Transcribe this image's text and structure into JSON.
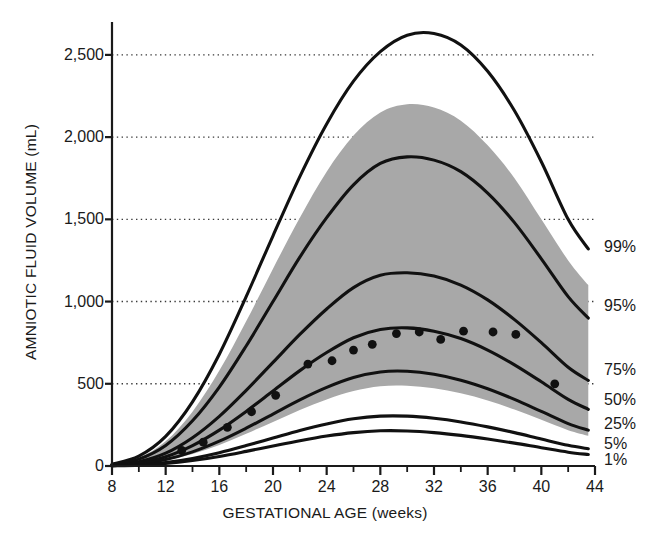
{
  "chart_data": {
    "type": "line",
    "title": "",
    "xlabel": "GESTATIONAL AGE (weeks)",
    "ylabel": "AMNIOTIC FLUID VOLUME (mL)",
    "xlim": [
      8,
      44
    ],
    "ylim": [
      0,
      2700
    ],
    "xticks": [
      8,
      12,
      16,
      20,
      24,
      28,
      32,
      36,
      40,
      44
    ],
    "xtick_labels": [
      "8",
      "12",
      "16",
      "20",
      "24",
      "28",
      "32",
      "36",
      "40",
      "44"
    ],
    "xminor_ticks": [
      10,
      14,
      18,
      22,
      26,
      30,
      34,
      38,
      42
    ],
    "yticks": [
      0,
      500,
      1000,
      1500,
      2000,
      2500
    ],
    "ytick_labels": [
      "0",
      "500",
      "1,000",
      "1,500",
      "2,000",
      "2,500"
    ],
    "grid": "horizontal-dotted",
    "gridlines": [
      500,
      1000,
      1500,
      2000,
      2500
    ],
    "legend": "right-of-axes-inline-labels",
    "x": [
      8,
      10,
      12,
      14,
      16,
      18,
      20,
      22,
      24,
      26,
      28,
      30,
      32,
      34,
      36,
      38,
      40,
      42,
      43.5
    ],
    "series": [
      {
        "name": "99%",
        "label": "99%",
        "color": "#111111",
        "values": [
          10,
          60,
          180,
          390,
          680,
          1030,
          1400,
          1760,
          2080,
          2340,
          2520,
          2620,
          2630,
          2560,
          2400,
          2160,
          1850,
          1500,
          1320
        ]
      },
      {
        "name": "95%",
        "label": "95%",
        "color": "#111111",
        "values": [
          8,
          42,
          125,
          275,
          480,
          730,
          1000,
          1270,
          1510,
          1710,
          1840,
          1880,
          1860,
          1790,
          1660,
          1480,
          1260,
          1030,
          900
        ]
      },
      {
        "name": "75%",
        "label": "75%",
        "color": "#111111",
        "values": [
          5,
          26,
          78,
          172,
          302,
          460,
          630,
          800,
          955,
          1085,
          1160,
          1175,
          1155,
          1100,
          1010,
          890,
          750,
          600,
          520
        ]
      },
      {
        "name": "50%",
        "label": "50%",
        "color": "#111111",
        "values": [
          4,
          19,
          56,
          124,
          218,
          332,
          456,
          580,
          690,
          780,
          830,
          840,
          820,
          775,
          705,
          615,
          512,
          405,
          345
        ]
      },
      {
        "name": "25%",
        "label": "25%",
        "color": "#111111",
        "values": [
          3,
          13,
          39,
          86,
          151,
          230,
          316,
          402,
          478,
          538,
          572,
          576,
          558,
          522,
          470,
          405,
          332,
          258,
          218
        ]
      },
      {
        "name": "5%",
        "label": "5%",
        "color": "#111111",
        "values": [
          2,
          7,
          21,
          46,
          81,
          124,
          170,
          216,
          256,
          287,
          303,
          303,
          290,
          268,
          238,
          203,
          164,
          126,
          105
        ]
      },
      {
        "name": "1%",
        "label": "1%",
        "color": "#111111",
        "values": [
          1,
          5,
          15,
          33,
          58,
          89,
          122,
          154,
          182,
          203,
          214,
          213,
          203,
          186,
          164,
          139,
          111,
          84,
          70
        ]
      }
    ],
    "shaded_band": {
      "name": "reference-range-band",
      "color": "#a8a8a8",
      "upper_values": [
        9,
        50,
        150,
        330,
        580,
        880,
        1200,
        1510,
        1790,
        2010,
        2150,
        2200,
        2180,
        2100,
        1950,
        1750,
        1500,
        1250,
        1100
      ],
      "lower_values": [
        2,
        11,
        33,
        73,
        128,
        196,
        268,
        341,
        405,
        456,
        485,
        488,
        473,
        442,
        398,
        343,
        281,
        218,
        184
      ]
    },
    "scatter": {
      "name": "measured-data-points",
      "color": "#111111",
      "marker": "filled-circle",
      "points": [
        {
          "x": 13.2,
          "y": 95
        },
        {
          "x": 14.8,
          "y": 145
        },
        {
          "x": 16.6,
          "y": 235
        },
        {
          "x": 18.4,
          "y": 330
        },
        {
          "x": 20.2,
          "y": 430
        },
        {
          "x": 22.6,
          "y": 620
        },
        {
          "x": 24.4,
          "y": 640
        },
        {
          "x": 26.0,
          "y": 705
        },
        {
          "x": 27.4,
          "y": 740
        },
        {
          "x": 29.2,
          "y": 805
        },
        {
          "x": 30.9,
          "y": 815
        },
        {
          "x": 32.5,
          "y": 770
        },
        {
          "x": 34.2,
          "y": 820
        },
        {
          "x": 36.4,
          "y": 815
        },
        {
          "x": 38.1,
          "y": 800
        },
        {
          "x": 41.0,
          "y": 500
        }
      ]
    }
  },
  "percentile_labels": [
    {
      "id": "99",
      "text": "99%",
      "value": 1330
    },
    {
      "id": "95",
      "text": "95%",
      "value": 970
    },
    {
      "id": "75",
      "text": "75%",
      "value": 585
    },
    {
      "id": "50",
      "text": "50%",
      "value": 400
    },
    {
      "id": "25",
      "text": "25%",
      "value": 255
    },
    {
      "id": "5",
      "text": "5%",
      "value": 135
    },
    {
      "id": "1",
      "text": "1%",
      "value": 35
    }
  ]
}
